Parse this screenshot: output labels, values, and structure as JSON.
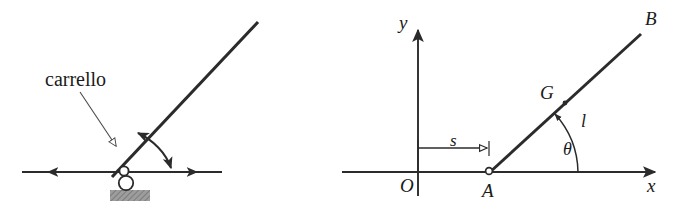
{
  "figure": {
    "title": "carrello",
    "background_color": "#ffffff",
    "ink_color": "#2b2b2b",
    "thin_ink_color": "#4a4a4a",
    "hatch_color": "#9a9a9a",
    "panels": [
      {
        "id": "left-panel",
        "name": "schematic-cart-support",
        "annotation_label": "carrello",
        "elements": [
          "horizontal-guide-rail",
          "left-arrowhead",
          "right-arrowhead",
          "roller-support",
          "pin-circle",
          "hatched-base-block",
          "inclined-bar",
          "rotation-double-arc-arrow",
          "leader-line-with-hollow-arrowhead"
        ]
      },
      {
        "id": "right-panel",
        "name": "coordinate-diagram",
        "elements": [
          "y-axis",
          "x-axis",
          "origin-label",
          "point-a",
          "point-b",
          "centroid-g",
          "bar-ab",
          "distance-s-dimension",
          "angle-theta-arc",
          "length-l-label"
        ]
      }
    ]
  },
  "labels": {
    "carrello": "carrello",
    "y_axis": "y",
    "x_axis": "x",
    "origin": "O",
    "point_a": "A",
    "point_b": "B",
    "centroid": "G",
    "length": "l",
    "distance": "s",
    "angle": "θ"
  },
  "geometry": {
    "left": {
      "rail_y": 172,
      "rail_x_start": 22,
      "rail_x_end": 222,
      "support_x": 123,
      "bar_start": [
        112,
        176
      ],
      "bar_end": [
        258,
        22
      ],
      "arc_label": "rotation"
    },
    "right": {
      "origin": [
        418,
        172
      ],
      "y_axis_top": 18,
      "y_axis_bottom": 196,
      "x_axis_start": 342,
      "x_axis_end": 660,
      "point_a": [
        490,
        172
      ],
      "point_b": [
        640,
        35
      ],
      "centroid_g": [
        565,
        104
      ],
      "theta_deg": 42,
      "s_line_y": 148,
      "s_start_x": 418,
      "s_end_x": 490
    }
  }
}
